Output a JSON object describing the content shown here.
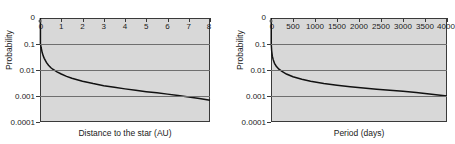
{
  "figure": {
    "background": "#ffffff",
    "plot_background": "#d8d8d8",
    "grid_color": "#6f6f6f",
    "axis_color": "#3a3a3a",
    "curve_color": "#111111"
  },
  "chart_data": [
    {
      "type": "line",
      "title": "",
      "xlabel": "Distance to the star (AU)",
      "ylabel": "Probability",
      "xlim": [
        0,
        8
      ],
      "ylim": [
        0.0001,
        1
      ],
      "yscale": "log",
      "grid": true,
      "legend": "none",
      "corner_label": "0",
      "xticks": [
        0,
        1,
        2,
        3,
        4,
        5,
        6,
        7,
        8
      ],
      "xticklabels": [
        "0",
        "1",
        "2",
        "3",
        "4",
        "5",
        "6",
        "7",
        "8"
      ],
      "xtick_position": "top",
      "yticks": [
        0.1,
        0.01,
        0.001,
        0.0001
      ],
      "yticklabels": [
        "0.1",
        "0.01",
        "0.001",
        "0.0001"
      ],
      "gridlines_y": [
        0.1,
        0.01,
        0.001
      ],
      "series": [
        {
          "name": "detection probability vs distance",
          "x": [
            0.02,
            0.05,
            0.1,
            0.15,
            0.2,
            0.3,
            0.4,
            0.5,
            0.6,
            0.8,
            1.0,
            1.25,
            1.5,
            2.0,
            2.5,
            3.0,
            3.5,
            4.0,
            4.5,
            5.0,
            5.5,
            6.0,
            6.5,
            7.0,
            7.5,
            8.0
          ],
          "y": [
            0.105,
            0.075,
            0.048,
            0.035,
            0.028,
            0.0195,
            0.0152,
            0.0125,
            0.0107,
            0.0085,
            0.007,
            0.0057,
            0.0048,
            0.0037,
            0.003,
            0.0025,
            0.00215,
            0.00188,
            0.00165,
            0.00147,
            0.00132,
            0.00118,
            0.00105,
            0.00092,
            0.0008,
            0.00068
          ]
        }
      ]
    },
    {
      "type": "line",
      "title": "",
      "xlabel": "Period (days)",
      "ylabel": "Probability",
      "xlim": [
        0,
        4000
      ],
      "ylim": [
        0.0001,
        1
      ],
      "yscale": "log",
      "grid": true,
      "legend": "none",
      "corner_label": "0",
      "xticks": [
        0,
        500,
        1000,
        1500,
        2000,
        2500,
        3000,
        3500,
        4000
      ],
      "xticklabels": [
        "0",
        "500",
        "1000",
        "1500",
        "2000",
        "2500",
        "3000",
        "3500",
        "4000"
      ],
      "xtick_position": "top",
      "yticks": [
        0.1,
        0.01,
        0.001,
        0.0001
      ],
      "yticklabels": [
        "0.1",
        "0.01",
        "0.001",
        "0.0001"
      ],
      "gridlines_y": [
        0.1,
        0.01,
        0.001
      ],
      "series": [
        {
          "name": "detection probability vs period",
          "x": [
            5,
            15,
            30,
            50,
            80,
            120,
            180,
            250,
            350,
            500,
            700,
            900,
            1200,
            1500,
            1800,
            2100,
            2400,
            2700,
            3000,
            3300,
            3600,
            4000
          ],
          "y": [
            0.105,
            0.055,
            0.034,
            0.025,
            0.018,
            0.014,
            0.0108,
            0.0088,
            0.007,
            0.0055,
            0.0044,
            0.0037,
            0.003,
            0.0026,
            0.00228,
            0.00203,
            0.00183,
            0.00166,
            0.00151,
            0.00136,
            0.0012,
            0.001
          ]
        }
      ]
    }
  ]
}
